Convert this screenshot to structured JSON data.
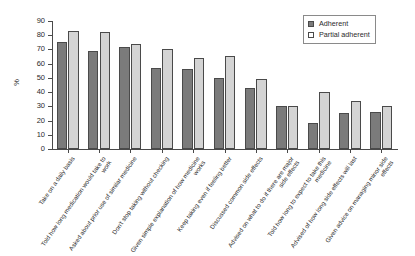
{
  "chart_data": {
    "type": "bar",
    "title": "",
    "subtitle": "",
    "xlabel": "",
    "ylabel": "%",
    "ylim": [
      0,
      90
    ],
    "yticks": [
      0,
      10,
      20,
      30,
      40,
      50,
      60,
      70,
      80,
      90
    ],
    "grid": false,
    "legend_position": "top-right",
    "categories": [
      "Take on a daily basis",
      "Told how long medication would take to work",
      "Asked about prior use of similar medicine",
      "Don't stop taking without checking",
      "Given simple explanation of how medicine works",
      "Keep taking even if feeling better",
      "Discussed common side effects",
      "Advised on what to do if there are major side effects",
      "Told how long to expect to take this medicine",
      "Advised of how long side effects will last",
      "Given advice on managing minor side effects"
    ],
    "series": [
      {
        "name": "Adherent",
        "color": "#7b7b7b",
        "values": [
          75,
          69,
          72,
          57,
          56,
          50,
          43,
          30,
          18,
          25,
          26
        ]
      },
      {
        "name": "Partial adherent",
        "color": "#d4d4d4",
        "values": [
          83,
          82,
          74,
          70,
          64,
          65.5,
          49,
          30.5,
          40,
          34,
          30
        ]
      }
    ]
  },
  "legend": {
    "items": [
      {
        "label": "Adherent",
        "swatch": "filled-square-dark"
      },
      {
        "label": "Partial adherent",
        "swatch": "empty-square-light"
      }
    ]
  },
  "axes": {
    "y_title": "%",
    "y_tick_labels": [
      "0",
      "10",
      "20",
      "30",
      "40",
      "50",
      "60",
      "70",
      "80",
      "90"
    ]
  },
  "colors": {
    "adherent": "#7b7b7b",
    "partial_adherent": "#d4d4d4",
    "axis": "#4a4a4a",
    "text": "#2b2b2b",
    "background": "#ffffff"
  }
}
